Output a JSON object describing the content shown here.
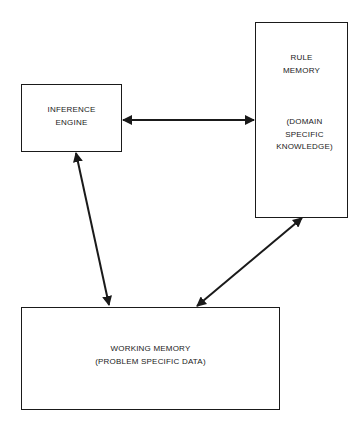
{
  "diagram": {
    "nodes": {
      "inference_engine": {
        "lines": [
          "INFERENCE",
          "ENGINE"
        ]
      },
      "rule_memory": {
        "title_lines": [
          "RULE",
          "MEMORY"
        ],
        "subtitle_lines": [
          "(DOMAIN",
          "SPECIFIC",
          "KNOWLEDGE)"
        ]
      },
      "working_memory": {
        "lines": [
          "WORKING MEMORY",
          "(PROBLEM SPECIFIC DATA)"
        ]
      }
    },
    "edges": [
      {
        "from": "inference_engine",
        "to": "rule_memory",
        "direction": "bidirectional"
      },
      {
        "from": "inference_engine",
        "to": "working_memory",
        "direction": "bidirectional"
      },
      {
        "from": "rule_memory",
        "to": "working_memory",
        "direction": "bidirectional"
      }
    ],
    "colors": {
      "stroke": "#1a1a1a",
      "background": "#ffffff"
    }
  }
}
